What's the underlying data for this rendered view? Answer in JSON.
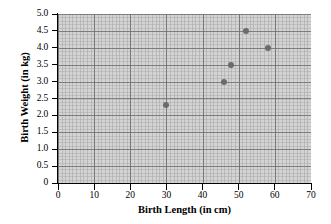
{
  "chart_data": {
    "type": "scatter",
    "title": "",
    "xlabel": "Birth Length (in cm)",
    "ylabel": "Birth Weight (in kg)",
    "xlim": [
      0,
      70
    ],
    "ylim": [
      0,
      5.0
    ],
    "xticks": [
      "0",
      "10",
      "20",
      "30",
      "40",
      "50",
      "60",
      "70"
    ],
    "xtick_values": [
      0,
      10,
      20,
      30,
      40,
      50,
      60,
      70
    ],
    "yticks": [
      "0",
      "0.5",
      "1.0",
      "1.5",
      "2.0",
      "2.5",
      "3.0",
      "3.5",
      "4.0",
      "4.5",
      "5.0"
    ],
    "ytick_values": [
      0,
      0.5,
      1.0,
      1.5,
      2.0,
      2.5,
      3.0,
      3.5,
      4.0,
      4.5,
      5.0
    ],
    "grid": true,
    "legend": false,
    "series": [
      {
        "name": "Births",
        "marker": "circle",
        "color": "#6b6b6b",
        "points": [
          {
            "x": 30,
            "y": 2.3
          },
          {
            "x": 46,
            "y": 3.0
          },
          {
            "x": 48,
            "y": 3.5
          },
          {
            "x": 52,
            "y": 4.5
          },
          {
            "x": 58,
            "y": 4.0
          }
        ]
      }
    ]
  },
  "style": {
    "plot_background": "#d4d4d4",
    "page_background": "#ffffff",
    "axis_color": "#000000",
    "marker_color": "#6b6b6b",
    "grid_color": "#9a9a9a"
  }
}
